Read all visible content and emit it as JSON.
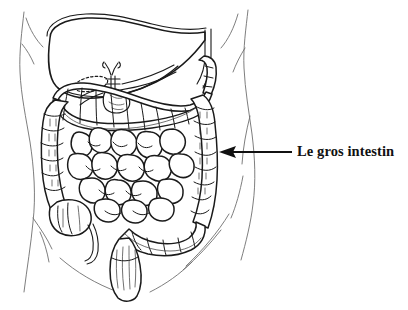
{
  "figure": {
    "title": "Le gros intestin",
    "language": "fr",
    "background_color": "#ffffff",
    "ink_color": "#1a1a1a",
    "body_outline_color": "#6f6f6f",
    "width": 408,
    "height": 310
  },
  "callout": {
    "label": "Le gros intestin",
    "arrow": {
      "direction": "left",
      "tail_x": 292,
      "tail_y": 152,
      "tip_x": 220,
      "tip_y": 152,
      "color": "#111111"
    },
    "points_to": "descending-colon"
  },
  "structures": [
    {
      "id": "body-torso",
      "label": "Torse",
      "kind": "contour"
    },
    {
      "id": "liver",
      "label": "Foie",
      "kind": "organ"
    },
    {
      "id": "bile-duct",
      "label": "Voies biliaires",
      "kind": "duct"
    },
    {
      "id": "gallbladder",
      "label": "Vesicule biliaire",
      "kind": "organ"
    },
    {
      "id": "pancreas",
      "label": "Pancreas",
      "kind": "organ"
    },
    {
      "id": "transverse-colon",
      "label": "Colon transverse",
      "kind": "large-intestine"
    },
    {
      "id": "ascending-colon",
      "label": "Colon ascendant",
      "kind": "large-intestine"
    },
    {
      "id": "descending-colon",
      "label": "Colon descendant",
      "kind": "large-intestine"
    },
    {
      "id": "splenic-flexure",
      "label": "Angle splenique",
      "kind": "large-intestine"
    },
    {
      "id": "cecum",
      "label": "Caecum",
      "kind": "large-intestine"
    },
    {
      "id": "appendix",
      "label": "Appendice",
      "kind": "large-intestine"
    },
    {
      "id": "sigmoid-colon",
      "label": "Colon sigmoide",
      "kind": "large-intestine"
    },
    {
      "id": "rectum",
      "label": "Rectum",
      "kind": "large-intestine"
    },
    {
      "id": "small-intestine",
      "label": "Intestin grele",
      "kind": "small-intestine"
    }
  ]
}
